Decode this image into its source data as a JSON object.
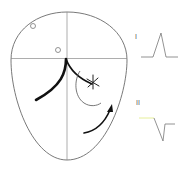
{
  "diagram": {
    "type": "head-outline-with-waveforms",
    "colors": {
      "outline": "#6a6a6a",
      "guide_lines": "#8a8a8a",
      "thick_stroke": "#111111",
      "waveform": "#777777",
      "waveform_highlight": "#e6ef9a",
      "background": "#ffffff"
    },
    "head": {
      "landmarks": [
        {
          "name": "small-circle-upper",
          "shape": "circle"
        },
        {
          "name": "small-circle-center",
          "shape": "circle"
        }
      ],
      "markers": [
        {
          "name": "asterisk",
          "glyph": "*"
        },
        {
          "name": "directional-arrow",
          "glyph": "arrow"
        }
      ]
    },
    "waveforms": [
      {
        "label": "I",
        "shape": "upward-spike"
      },
      {
        "label": "II",
        "shape": "downward-spike"
      }
    ]
  }
}
